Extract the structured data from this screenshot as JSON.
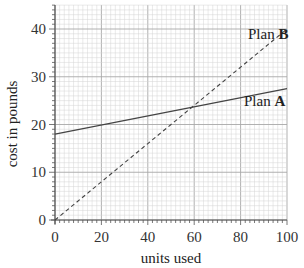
{
  "chart_data": {
    "type": "line",
    "title": "",
    "xlabel": "units used",
    "ylabel": "cost in pounds",
    "xlim": [
      0,
      100
    ],
    "ylim": [
      0,
      44
    ],
    "xticks": [
      0,
      20,
      40,
      60,
      80,
      100
    ],
    "yticks": [
      0,
      10,
      20,
      30,
      40
    ],
    "grid": true,
    "series": [
      {
        "name": "Plan A",
        "name_prefix": "Plan ",
        "name_bold": "A",
        "style": "solid",
        "x": [
          0,
          100
        ],
        "y": [
          18,
          27.5
        ]
      },
      {
        "name": "Plan B",
        "name_prefix": "Plan ",
        "name_bold": "B",
        "style": "dashed",
        "x": [
          0,
          100
        ],
        "y": [
          0,
          40
        ]
      }
    ],
    "colors": {
      "line": "#444444",
      "grid_minor": "#d4d4d4",
      "grid_major": "#a8a8a8",
      "axis": "#555555"
    }
  }
}
